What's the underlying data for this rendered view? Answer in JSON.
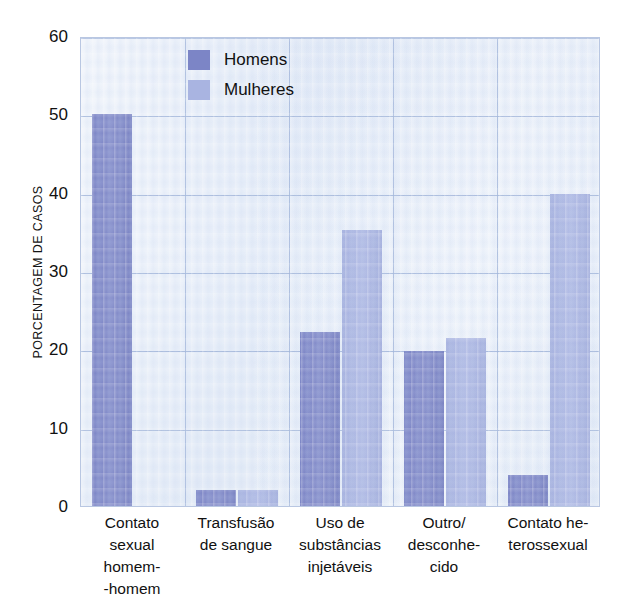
{
  "chart_data": {
    "type": "bar",
    "title": "",
    "xlabel": "",
    "ylabel": "PORCENTAGEM DE CASOS",
    "ylim": [
      0,
      60
    ],
    "yticks": [
      0,
      10,
      20,
      30,
      40,
      50,
      60
    ],
    "grid": true,
    "legend_position": "top-left-inside",
    "categories": [
      "Contato sexual homem--homem",
      "Transfusão de sangue",
      "Uso de substâncias injetáveis",
      "Outro/ desconhecido",
      "Contato heterossexual"
    ],
    "category_lines": [
      [
        "Contato",
        "sexual",
        "homem-",
        "-homem"
      ],
      [
        "Transfusão",
        "de sangue"
      ],
      [
        "Uso de",
        "substâncias",
        "injetáveis"
      ],
      [
        "Outro/",
        "desconhe-",
        "cido"
      ],
      [
        "Contato he-",
        "terossexual"
      ]
    ],
    "series": [
      {
        "name": "Homens",
        "color": "#7c85c6",
        "values": [
          50,
          2,
          22.2,
          19.8,
          4
        ]
      },
      {
        "name": "Mulheres",
        "color": "#a9b4e1",
        "values": [
          0,
          2,
          35.2,
          21.4,
          39.8
        ]
      }
    ]
  },
  "legend": {
    "items": [
      {
        "label": "Homens"
      },
      {
        "label": "Mulheres"
      }
    ]
  },
  "axes": {
    "y_title": "PORCENTAGEM DE CASOS",
    "y_tick_labels": [
      "0",
      "10",
      "20",
      "30",
      "40",
      "50",
      "60"
    ]
  },
  "colors": {
    "homens": "#7c85c6",
    "mulheres": "#a9b4e1",
    "plot_background": "#e4ecf7",
    "gridline": "#9fb3d8",
    "plot_border": "#b9c7e2",
    "text": "#111111"
  }
}
